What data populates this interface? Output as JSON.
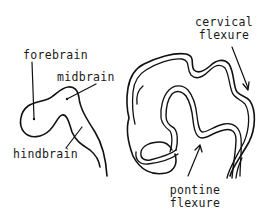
{
  "diagram": {
    "type": "anatomical-line-drawing",
    "stroke_color": "#111111",
    "background_color": "#ffffff",
    "left_figure": {
      "labels": {
        "forebrain": "forebrain",
        "midbrain": "midbrain",
        "hindbrain": "hindbrain"
      }
    },
    "right_figure": {
      "labels": {
        "cervical_flexure_line1": "cervical",
        "cervical_flexure_line2": "flexure",
        "pontine_flexure_line1": "pontine",
        "pontine_flexure_line2": "flexure"
      }
    }
  }
}
